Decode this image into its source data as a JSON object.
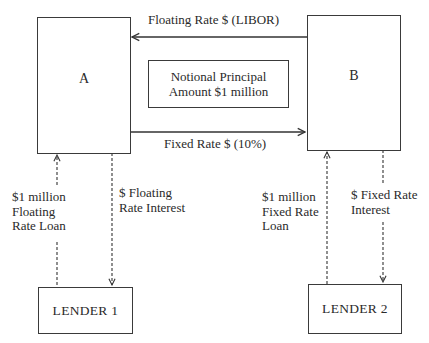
{
  "diagram": {
    "type": "interest-rate-swap",
    "parties": {
      "a": {
        "label": "A"
      },
      "b": {
        "label": "B"
      }
    },
    "notional": {
      "line1": "Notional Principal",
      "line2": "Amount $1 million"
    },
    "swap_flows": {
      "floating": {
        "label": "Floating Rate $ (LIBOR)",
        "from": "B",
        "to": "A"
      },
      "fixed": {
        "label": "Fixed Rate $ (10%)",
        "from": "A",
        "to": "B"
      }
    },
    "lenders": {
      "lender1": {
        "label": "LENDER 1"
      },
      "lender2": {
        "label": "LENDER 2"
      }
    },
    "loan_flows": {
      "lender1_loan": {
        "line1": "$1 million",
        "line2": "Floating",
        "line3": "Rate Loan",
        "from": "LENDER 1",
        "to": "A"
      },
      "lender1_interest": {
        "line1": "$ Floating",
        "line2": "Rate Interest",
        "from": "A",
        "to": "LENDER 1"
      },
      "lender2_loan": {
        "line1": "$1 million",
        "line2": "Fixed Rate",
        "line3": "Loan",
        "from": "LENDER 2",
        "to": "B"
      },
      "lender2_interest": {
        "line1": "$ Fixed Rate",
        "line2": "Interest",
        "from": "B",
        "to": "LENDER 2"
      }
    }
  }
}
